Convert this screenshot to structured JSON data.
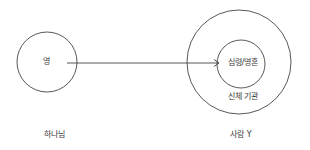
{
  "diagram": {
    "source_node": {
      "inner_label": "영",
      "caption": "하나님"
    },
    "target_node": {
      "inner_label": "심령/영혼",
      "outer_label": "신체 기관",
      "caption": "사람 Y"
    },
    "edge": {
      "from": "영",
      "to": "심령/영혼",
      "type": "arrow"
    },
    "colors": {
      "stroke": "#444444",
      "text": "#3a3a3a",
      "background": "#ffffff"
    }
  }
}
